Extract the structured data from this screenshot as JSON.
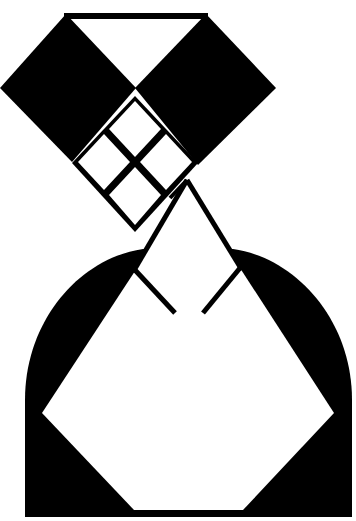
{
  "figure": {
    "colors": {
      "ink": "#000000",
      "paper": "#ffffff"
    },
    "components": [
      "top-bar",
      "left-diamond",
      "right-diamond",
      "top-triangle-cutout",
      "small-square-grid",
      "neck-triangle",
      "arch",
      "body-polygon"
    ]
  }
}
